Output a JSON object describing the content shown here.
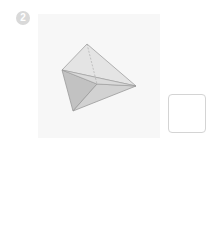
{
  "question": {
    "number": "2",
    "figure": {
      "shape": "triangular-pyramid",
      "vertices": {
        "top": [
          87,
          44
        ],
        "left": [
          62,
          70
        ],
        "right": [
          136,
          86
        ],
        "bottom": [
          73,
          111
        ],
        "inner": [
          97,
          84
        ]
      },
      "colors": {
        "light_face": "#e3e3e3",
        "dark_face": "#c4c4c4",
        "edge": "#9a9a9a"
      }
    },
    "answer": ""
  }
}
